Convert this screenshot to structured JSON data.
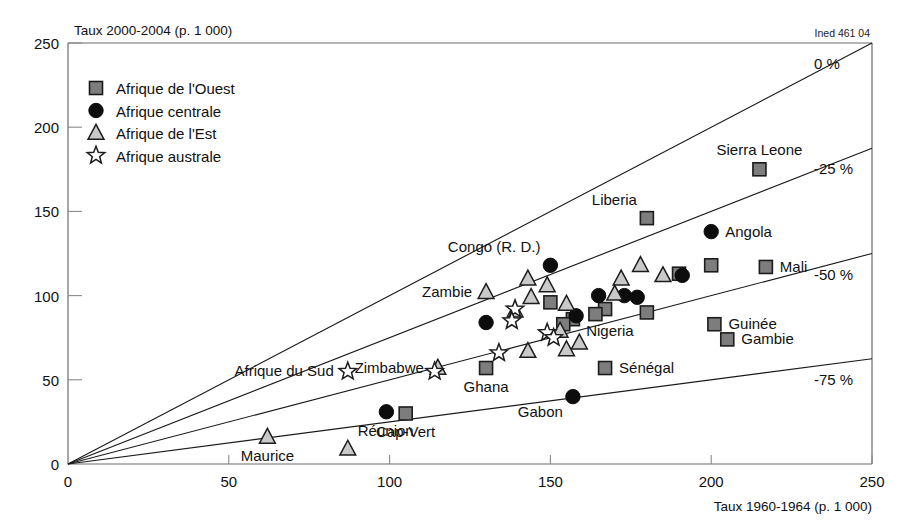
{
  "credit": "Ined 461 04",
  "legend": {
    "items": [
      {
        "marker": "square-marker",
        "label": "Afrique de l'Ouest"
      },
      {
        "marker": "circle-marker",
        "label": "Afrique centrale"
      },
      {
        "marker": "triangle-marker",
        "label": "Afrique de l'Est"
      },
      {
        "marker": "star-marker",
        "label": "Afrique australe"
      }
    ]
  },
  "chart_data": {
    "type": "scatter",
    "title": "",
    "ylabel": "Taux 2000-2004 (p. 1 000)",
    "xlabel": "Taux 1960-1964 (p. 1 000)",
    "xlim": [
      0,
      250
    ],
    "ylim": [
      0,
      250
    ],
    "xticks": [
      0,
      50,
      100,
      150,
      200,
      250
    ],
    "yticks": [
      0,
      50,
      100,
      150,
      200,
      250
    ],
    "grid": false,
    "legend_position": "top-left",
    "reference_lines": [
      {
        "label": "0 %",
        "ratio": 1.0
      },
      {
        "label": "-25 %",
        "ratio": 0.75
      },
      {
        "label": "-50 %",
        "ratio": 0.5
      },
      {
        "label": "-75 %",
        "ratio": 0.25
      }
    ],
    "series": [
      {
        "name": "Afrique de l'Ouest",
        "marker": "square",
        "points": [
          {
            "x": 215,
            "y": 175,
            "label": "Sierra Leone",
            "label_pos": "top"
          },
          {
            "x": 180,
            "y": 146,
            "label": "Liberia",
            "label_pos": "top-left"
          },
          {
            "x": 217,
            "y": 117,
            "label": "Mali",
            "label_pos": "right"
          },
          {
            "x": 200,
            "y": 118,
            "label": "",
            "label_pos": ""
          },
          {
            "x": 190,
            "y": 113,
            "label": "",
            "label_pos": ""
          },
          {
            "x": 201,
            "y": 83,
            "label": "Guinée",
            "label_pos": "right"
          },
          {
            "x": 205,
            "y": 74,
            "label": "Gambie",
            "label_pos": "right"
          },
          {
            "x": 180,
            "y": 90,
            "label": "",
            "label_pos": ""
          },
          {
            "x": 167,
            "y": 92,
            "label": "",
            "label_pos": ""
          },
          {
            "x": 164,
            "y": 89,
            "label": "",
            "label_pos": ""
          },
          {
            "x": 157,
            "y": 86,
            "label": "",
            "label_pos": ""
          },
          {
            "x": 154,
            "y": 83,
            "label": "",
            "label_pos": ""
          },
          {
            "x": 150,
            "y": 96,
            "label": "",
            "label_pos": ""
          },
          {
            "x": 167,
            "y": 57,
            "label": "Sénégal",
            "label_pos": "right"
          },
          {
            "x": 130,
            "y": 57,
            "label": "Ghana",
            "label_pos": "bottom"
          },
          {
            "x": 105,
            "y": 30,
            "label": "Cap-Vert",
            "label_pos": "bottom"
          }
        ]
      },
      {
        "name": "Afrique centrale",
        "marker": "circle",
        "points": [
          {
            "x": 200,
            "y": 138,
            "label": "Angola",
            "label_pos": "right"
          },
          {
            "x": 150,
            "y": 118,
            "label": "Congo (R. D.)",
            "label_pos": "top-left"
          },
          {
            "x": 191,
            "y": 112,
            "label": "",
            "label_pos": ""
          },
          {
            "x": 173,
            "y": 100,
            "label": "",
            "label_pos": ""
          },
          {
            "x": 177,
            "y": 99,
            "label": "",
            "label_pos": ""
          },
          {
            "x": 165,
            "y": 100,
            "label": "",
            "label_pos": ""
          },
          {
            "x": 158,
            "y": 88,
            "label": "Nigeria",
            "label_pos": "bottom-right"
          },
          {
            "x": 130,
            "y": 84,
            "label": "",
            "label_pos": ""
          },
          {
            "x": 157,
            "y": 40,
            "label": "Gabon",
            "label_pos": "bottom-left"
          },
          {
            "x": 99,
            "y": 31,
            "label": "",
            "label_pos": ""
          }
        ]
      },
      {
        "name": "Afrique de l'Est",
        "marker": "triangle",
        "points": [
          {
            "x": 130,
            "y": 102,
            "label": "Zambie",
            "label_pos": "left"
          },
          {
            "x": 143,
            "y": 110,
            "label": "",
            "label_pos": ""
          },
          {
            "x": 149,
            "y": 106,
            "label": "",
            "label_pos": ""
          },
          {
            "x": 144,
            "y": 99,
            "label": "",
            "label_pos": ""
          },
          {
            "x": 178,
            "y": 118,
            "label": "",
            "label_pos": ""
          },
          {
            "x": 172,
            "y": 110,
            "label": "",
            "label_pos": ""
          },
          {
            "x": 185,
            "y": 112,
            "label": "",
            "label_pos": ""
          },
          {
            "x": 139,
            "y": 91,
            "label": "",
            "label_pos": ""
          },
          {
            "x": 155,
            "y": 95,
            "label": "",
            "label_pos": ""
          },
          {
            "x": 170,
            "y": 101,
            "label": "",
            "label_pos": ""
          },
          {
            "x": 153,
            "y": 79,
            "label": "",
            "label_pos": ""
          },
          {
            "x": 159,
            "y": 72,
            "label": "",
            "label_pos": ""
          },
          {
            "x": 155,
            "y": 68,
            "label": "",
            "label_pos": ""
          },
          {
            "x": 143,
            "y": 67,
            "label": "",
            "label_pos": ""
          },
          {
            "x": 115,
            "y": 57,
            "label": "Zimbabwe",
            "label_pos": "left"
          },
          {
            "x": 62,
            "y": 16,
            "label": "Maurice",
            "label_pos": "bottom"
          },
          {
            "x": 87,
            "y": 9,
            "label": "Réunion",
            "label_pos": "top-right"
          }
        ]
      },
      {
        "name": "Afrique australe",
        "marker": "star",
        "points": [
          {
            "x": 139,
            "y": 92,
            "label": "",
            "label_pos": ""
          },
          {
            "x": 138,
            "y": 85,
            "label": "",
            "label_pos": ""
          },
          {
            "x": 149,
            "y": 78,
            "label": "",
            "label_pos": ""
          },
          {
            "x": 151,
            "y": 75,
            "label": "",
            "label_pos": ""
          },
          {
            "x": 134,
            "y": 66,
            "label": "",
            "label_pos": ""
          },
          {
            "x": 114,
            "y": 55,
            "label": "",
            "label_pos": ""
          },
          {
            "x": 87,
            "y": 55,
            "label": "Afrique du Sud",
            "label_pos": "left"
          }
        ]
      }
    ]
  }
}
